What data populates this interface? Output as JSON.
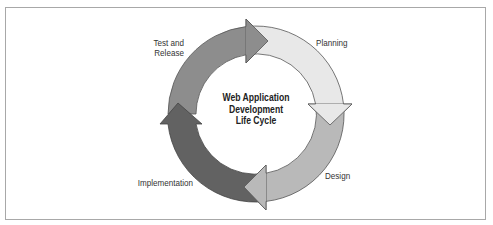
{
  "diagram": {
    "title_lines": [
      "Web Application",
      "Development",
      "Life Cycle"
    ],
    "stages": [
      {
        "id": "planning",
        "label_lines": [
          "Planning"
        ],
        "color": "#e8e8e8"
      },
      {
        "id": "design",
        "label_lines": [
          "Design"
        ],
        "color": "#b9b9b9"
      },
      {
        "id": "implementation",
        "label_lines": [
          "Implementation"
        ],
        "color": "#626262"
      },
      {
        "id": "test-release",
        "label_lines": [
          "Test and",
          "Release"
        ],
        "color": "#8d8d8d"
      }
    ],
    "flow": "clockwise",
    "stroke_color": "#555555",
    "frame_border_color": "#a8a8a8"
  }
}
